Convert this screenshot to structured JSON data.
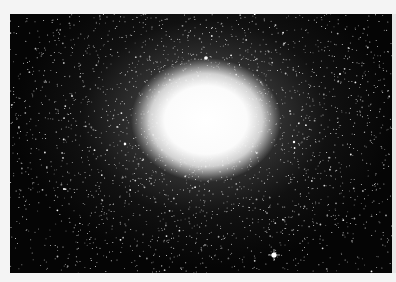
{
  "image": {
    "subject": "globular star cluster",
    "alt": "Dense globular star cluster with bright white core on black star field",
    "colors": {
      "background": "#f4f4f4",
      "sky": "#050505",
      "core": "#ffffff"
    },
    "core_center": [
      206,
      120
    ],
    "bright_star": [
      274,
      255
    ]
  }
}
